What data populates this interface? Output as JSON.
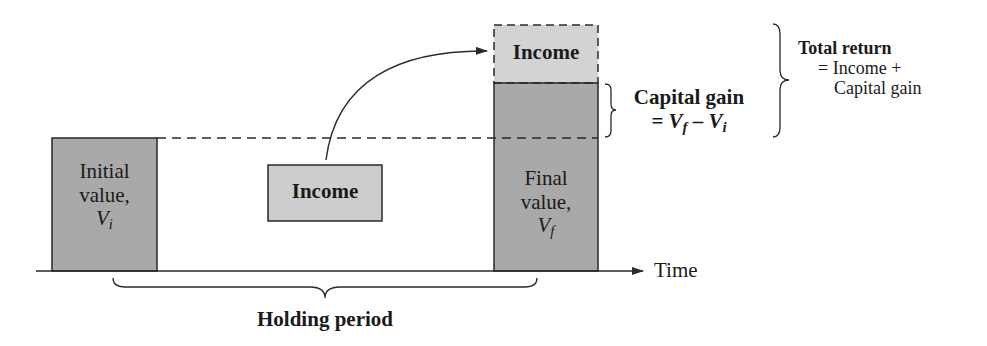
{
  "colors": {
    "bar_fill": "#a9a9a9",
    "income_fill": "#cdcdcd",
    "top_income_fill": "#d3d3d3",
    "stroke": "#2a2a2a",
    "background": "#ffffff"
  },
  "axis": {
    "label": "Time"
  },
  "initial_bar": {
    "line1": "Initial",
    "line2": "value,",
    "symbol": "V",
    "subscript": "i"
  },
  "middle_income": {
    "label": "Income"
  },
  "final_bar": {
    "line1": "Final",
    "line2": "value,",
    "symbol": "V",
    "subscript": "f"
  },
  "top_income": {
    "label": "Income"
  },
  "capital_gain": {
    "title": "Capital gain",
    "formula_prefix": "= ",
    "v1": "V",
    "v1_sub": "f",
    "minus": " – ",
    "v2": "V",
    "v2_sub": "i"
  },
  "total_return": {
    "title": "Total return",
    "line2": "= Income +",
    "line3": "Capital gain"
  },
  "holding_period": {
    "label": "Holding period"
  }
}
